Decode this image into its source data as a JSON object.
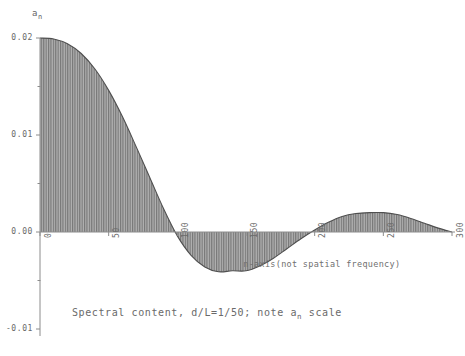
{
  "chart_data": {
    "type": "area",
    "title": "",
    "caption": "Spectral content, d/L=1/50; note a",
    "caption_subscript": "n",
    "caption_tail": " scale",
    "ylabel": "a",
    "ylabel_subscript": "n",
    "xlabel": "n-axis(not spatial frequency)",
    "xticks": [
      0,
      50,
      100,
      150,
      200,
      250,
      300
    ],
    "xtick_labels": [
      "0",
      "50",
      "100",
      "150",
      "200",
      "250",
      "300"
    ],
    "yticks": [
      -0.01,
      0.0,
      0.01,
      0.02
    ],
    "ytick_labels": [
      "-0.01",
      "0.00",
      "0.01",
      "0.02"
    ],
    "xlim": [
      0,
      300
    ],
    "ylim": [
      -0.01,
      0.02
    ],
    "grid": false,
    "legend": null,
    "fill_style": "vertical-hatch-stems",
    "fill_color": "#8a8a8a",
    "line_color": "#4a4a4a",
    "axis_color": "#8c8c8c",
    "x": [
      0,
      10,
      20,
      30,
      40,
      50,
      60,
      70,
      80,
      90,
      100,
      110,
      120,
      130,
      140,
      150,
      160,
      170,
      180,
      190,
      200,
      210,
      220,
      230,
      240,
      250,
      260,
      270,
      280,
      290,
      300
    ],
    "values": [
      0.02,
      0.0199,
      0.0194,
      0.0184,
      0.0168,
      0.0146,
      0.0119,
      0.0088,
      0.0056,
      0.0024,
      -0.0004,
      -0.0024,
      -0.0036,
      -0.0041,
      -0.004,
      -0.004,
      -0.0035,
      -0.0027,
      -0.0017,
      -0.0007,
      0.0002,
      0.001,
      0.0016,
      0.0019,
      0.002,
      0.002,
      0.0018,
      0.0014,
      0.0009,
      0.0004,
      0.0
    ],
    "notes": {
      "main_lobe_peak": 0.02,
      "first_zero_crossing": 100,
      "negative_lobe_min": -0.0041,
      "second_zero_crossing": 200,
      "second_lobe_peak": 0.002
    }
  }
}
